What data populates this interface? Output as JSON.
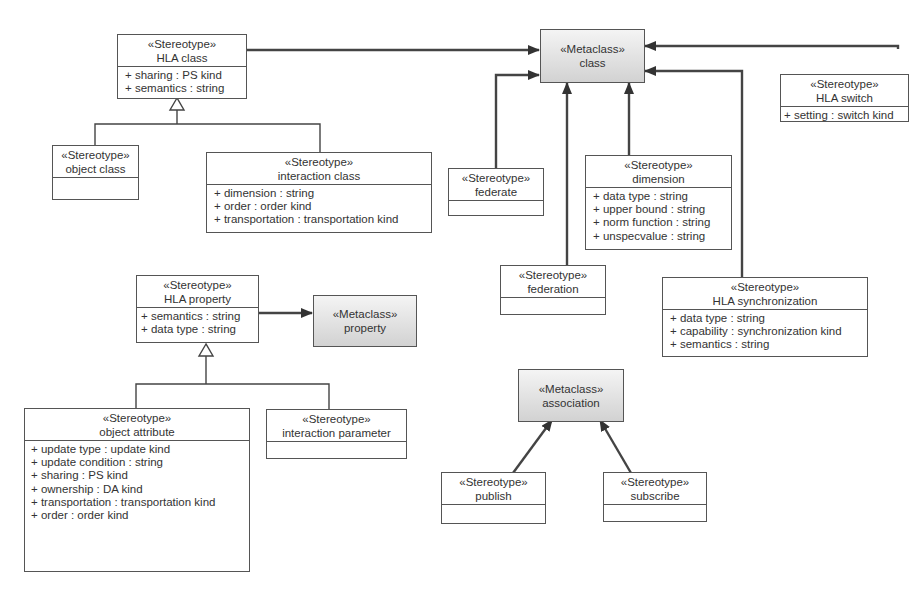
{
  "diagram": {
    "type": "UML profile diagram",
    "colors": {
      "line": "#444444",
      "metaclass_fill_top": "#f4f4f4",
      "metaclass_fill_bottom": "#d2d2d2",
      "box_border": "#555555"
    },
    "metaclasses": {
      "class": {
        "stereotype": "«Metaclass»",
        "name": "class"
      },
      "property": {
        "stereotype": "«Metaclass»",
        "name": "property"
      },
      "association": {
        "stereotype": "«Metaclass»",
        "name": "association"
      }
    },
    "stereotypes": {
      "hla_class": {
        "stereotype": "«Stereotype»",
        "name": "HLA class",
        "attributes": [
          "+ sharing : PS kind",
          "+ semantics : string"
        ]
      },
      "object_class": {
        "stereotype": "«Stereotype»",
        "name": "object class",
        "attributes": []
      },
      "interaction_class": {
        "stereotype": "«Stereotype»",
        "name": "interaction class",
        "attributes": [
          "+ dimension : string",
          "+ order : order kind",
          "+ transportation : transportation kind"
        ]
      },
      "federate": {
        "stereotype": "«Stereotype»",
        "name": "federate",
        "attributes": []
      },
      "dimension": {
        "stereotype": "«Stereotype»",
        "name": "dimension",
        "attributes": [
          "+ data type : string",
          "+ upper bound : string",
          "+ norm function : string",
          "+ unspecvalue : string"
        ]
      },
      "hla_switch": {
        "stereotype": "«Stereotype»",
        "name": "HLA switch",
        "attributes": [
          "+ setting : switch kind"
        ]
      },
      "federation": {
        "stereotype": "«Stereotype»",
        "name": "federation",
        "attributes": []
      },
      "hla_synchronization": {
        "stereotype": "«Stereotype»",
        "name": "HLA synchronization",
        "attributes": [
          "+ data type : string",
          "+ capability : synchronization kind",
          "+ semantics : string"
        ]
      },
      "hla_property": {
        "stereotype": "«Stereotype»",
        "name": "HLA property",
        "attributes": [
          "+ semantics : string",
          "+ data type : string"
        ]
      },
      "object_attribute": {
        "stereotype": "«Stereotype»",
        "name": "object attribute",
        "attributes": [
          "+ update type : update kind",
          "+ update condition : string",
          "+ sharing : PS kind",
          "+ ownership : DA kind",
          "+ transportation : transportation kind",
          "+ order : order kind"
        ]
      },
      "interaction_parameter": {
        "stereotype": "«Stereotype»",
        "name": "interaction parameter",
        "attributes": []
      },
      "publish": {
        "stereotype": "«Stereotype»",
        "name": "publish",
        "attributes": []
      },
      "subscribe": {
        "stereotype": "«Stereotype»",
        "name": "subscribe",
        "attributes": []
      }
    },
    "relations": [
      {
        "from": "HLA class",
        "to": "class",
        "kind": "extension"
      },
      {
        "from": "federate",
        "to": "class",
        "kind": "extension"
      },
      {
        "from": "federation",
        "to": "class",
        "kind": "extension"
      },
      {
        "from": "dimension",
        "to": "class",
        "kind": "extension"
      },
      {
        "from": "HLA synchronization",
        "to": "class",
        "kind": "extension"
      },
      {
        "from": "HLA switch",
        "to": "class",
        "kind": "extension"
      },
      {
        "from": "object class",
        "to": "HLA class",
        "kind": "generalization"
      },
      {
        "from": "interaction class",
        "to": "HLA class",
        "kind": "generalization"
      },
      {
        "from": "HLA property",
        "to": "property",
        "kind": "extension"
      },
      {
        "from": "object attribute",
        "to": "HLA property",
        "kind": "generalization"
      },
      {
        "from": "interaction parameter",
        "to": "HLA property",
        "kind": "generalization"
      },
      {
        "from": "publish",
        "to": "association",
        "kind": "extension"
      },
      {
        "from": "subscribe",
        "to": "association",
        "kind": "extension"
      }
    ]
  }
}
